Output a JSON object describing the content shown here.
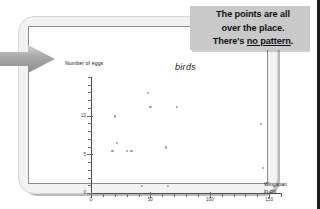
{
  "caption": {
    "line1": "The points are all",
    "line2": "over the place.",
    "line3_prefix": "There's ",
    "line3_underlined": "no pattern",
    "line3_suffix": "."
  },
  "annotation": {
    "arrow_icon": "arrow-right-icon"
  },
  "chart_data": {
    "type": "scatter",
    "title": "birds",
    "xlabel": "Wingspan\nin cm",
    "xlabel_line1": "Wingspan",
    "xlabel_line2": "in cm",
    "ylabel": "Number of eggs",
    "xlim": [
      0,
      160
    ],
    "ylim": [
      0,
      15
    ],
    "xticks": [
      0,
      50,
      100,
      150
    ],
    "xtick_labels": [
      "0",
      "50",
      "100",
      "150"
    ],
    "yticks": [
      0,
      5,
      10
    ],
    "ytick_labels": [
      "0",
      "5",
      "10"
    ],
    "xminor_step": 10,
    "yminor_step": 1,
    "grid": false,
    "legend": false,
    "point_color": "#9a9a9a",
    "points": [
      {
        "x": 18,
        "y": 5.5
      },
      {
        "x": 20,
        "y": 10.0
      },
      {
        "x": 22,
        "y": 6.6
      },
      {
        "x": 30,
        "y": 5.5
      },
      {
        "x": 34,
        "y": 5.5
      },
      {
        "x": 43,
        "y": 1.0
      },
      {
        "x": 48,
        "y": 13.0
      },
      {
        "x": 50,
        "y": 11.2
      },
      {
        "x": 63,
        "y": 6.0
      },
      {
        "x": 65,
        "y": 1.0
      },
      {
        "x": 72,
        "y": 11.2
      },
      {
        "x": 143,
        "y": 9.0
      },
      {
        "x": 145,
        "y": 3.4
      }
    ]
  }
}
